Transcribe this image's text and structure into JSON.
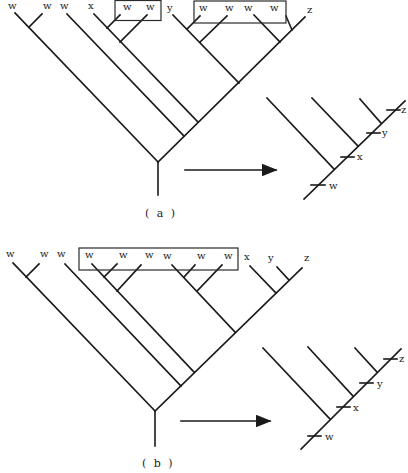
{
  "panels": {
    "a": {
      "caption": "( a )",
      "tree_labels": [
        "w",
        "w",
        "w",
        "x",
        "w",
        "w",
        "y",
        "w",
        "w",
        "w",
        "w",
        "z"
      ],
      "boxed_groups": [
        [
          "w",
          "w"
        ],
        [
          "w",
          "w",
          "w",
          "w"
        ]
      ],
      "reduced_tree": {
        "tick_labels": [
          "w",
          "x",
          "y",
          "z"
        ]
      }
    },
    "b": {
      "caption": "( b )",
      "tree_labels": [
        "w",
        "w",
        "w",
        "w",
        "w",
        "w",
        "w",
        "w",
        "w",
        "x",
        "y",
        "z"
      ],
      "boxed_groups": [
        [
          "w",
          "w",
          "w",
          "w",
          "w",
          "w"
        ]
      ],
      "reduced_tree": {
        "tick_labels": [
          "w",
          "x",
          "y",
          "z"
        ]
      }
    }
  },
  "colors": {
    "line": "#1a1a1a",
    "background": "#ffffff"
  }
}
